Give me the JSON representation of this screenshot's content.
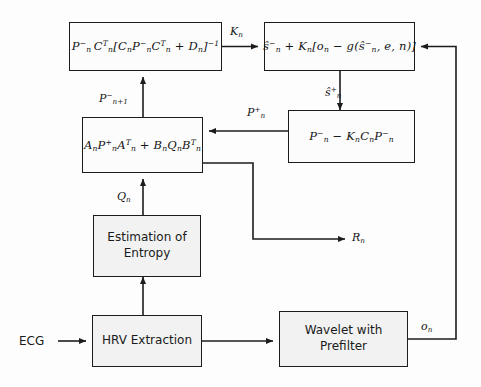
{
  "diagram": {
    "colors": {
      "box_fill": "#f2f2f2",
      "box_stroke": "#1c1c1c",
      "wire": "#1c1c1c",
      "background": "#fdfdfd",
      "text": "#141414"
    },
    "blocks": [
      {
        "id": "kalman-gain",
        "kind": "formula",
        "text": "P⁻ₙ Cᵀₙ[Cₙ P⁻ₙ Cᵀₙ + Dₙ]⁻¹",
        "parts": {
          "a": "P",
          "a_sup": "−",
          "a_sub": "n",
          "b": "C",
          "b_sup": "T",
          "b_sub": "n",
          "bracket_open": "[",
          "c": "C",
          "c_sub": "n",
          "d": "P",
          "d_sup": "−",
          "d_sub": "n",
          "e": "C",
          "e_sup": "T",
          "e_sub": "n",
          "plus": "+",
          "f": "D",
          "f_sub": "n",
          "bracket_close": "]",
          "inv": "−1"
        }
      },
      {
        "id": "state-update",
        "kind": "formula",
        "text": "ŝ⁻ₙ + Kₙ[oₙ − g(ŝ⁻ₙ, e, n)]"
      },
      {
        "id": "covariance-predict",
        "kind": "formula",
        "text": "Aₙ P⁺ₙ Aᵀₙ + Bₙ Qₙ Bᵀₙ"
      },
      {
        "id": "covariance-update",
        "kind": "formula",
        "text": "P⁻ₙ − Kₙ Cₙ P⁻ₙ"
      },
      {
        "id": "entropy-estimation",
        "kind": "label",
        "line1": "Estimation of",
        "line2": "Entropy"
      },
      {
        "id": "hrv-extraction",
        "kind": "label",
        "line1": "HRV Extraction",
        "line2": ""
      },
      {
        "id": "wavelet-prefilter",
        "kind": "label",
        "line1": "Wavelet with",
        "line2": "Prefilter"
      }
    ],
    "signals": {
      "kalman_gain": "K",
      "kalman_gain_sub": "n",
      "p_minus_next": "P",
      "p_minus_next_sup": "−",
      "p_minus_next_sub": "n+1",
      "p_plus": "P",
      "p_plus_sup": "+",
      "p_plus_sub": "n",
      "s_plus": "ŝ",
      "s_plus_sup": "+",
      "s_plus_sub": "n",
      "process_noise": "Q",
      "process_noise_sub": "n",
      "measurement_noise": "R",
      "measurement_noise_sub": "n",
      "observation": "o",
      "observation_sub": "n",
      "input": "ECG"
    }
  }
}
